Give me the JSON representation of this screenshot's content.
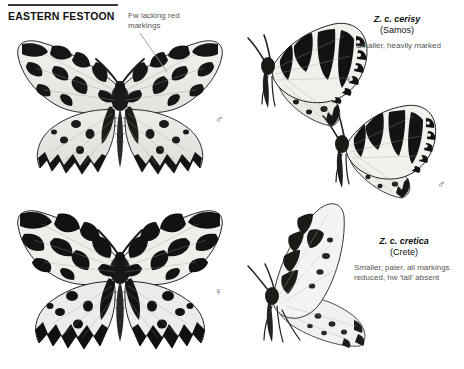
{
  "plate": {
    "title": "EASTERN FESTOON",
    "background": "#ffffff",
    "ink": "#111111",
    "caption_color": "#555555"
  },
  "callouts": [
    {
      "id": "fw-red-markings",
      "text": "Fw lacking red markings",
      "x": 128,
      "y": 11,
      "leader": {
        "x1": 140,
        "y1": 33,
        "x2": 167,
        "y2": 72
      }
    }
  ],
  "taxa": [
    {
      "id": "cerisy",
      "scientific": "Z. c. cerisy",
      "locality": "(Samos)",
      "description": "Smaller, heavily marked",
      "x": 356,
      "y": 14
    },
    {
      "id": "cretica",
      "scientific": "Z. c. cretica",
      "locality": "(Crete)",
      "description": "Smaller, paler, all markings reduced, hw 'tail' absent",
      "x": 348,
      "y": 236
    }
  ],
  "sex_marks": [
    {
      "id": "male-nominate",
      "symbol": "♂",
      "x": 215,
      "y": 114,
      "specimen": "nominate-male-dorsal"
    },
    {
      "id": "female-nominate",
      "symbol": "♀",
      "x": 214,
      "y": 286,
      "specimen": "nominate-female-dorsal"
    },
    {
      "id": "female-cerisy",
      "symbol": "♀",
      "x": 344,
      "y": 74,
      "specimen": "cerisy-female-lateral"
    },
    {
      "id": "male-cerisy",
      "symbol": "♂",
      "x": 437,
      "y": 179,
      "specimen": "cerisy-male-lateral"
    }
  ],
  "specimens": [
    {
      "id": "nominate-male-dorsal",
      "common_name": "Eastern Festoon",
      "view": "dorsal-spread",
      "sex": "male",
      "x": 14,
      "y": 28,
      "width": 210,
      "height": 160
    },
    {
      "id": "nominate-female-dorsal",
      "common_name": "Eastern Festoon",
      "view": "dorsal-spread",
      "sex": "female",
      "x": 14,
      "y": 200,
      "width": 210,
      "height": 160
    },
    {
      "id": "cerisy-female-lateral",
      "common_name": "Z. c. cerisy",
      "view": "lateral-closed",
      "sex": "female",
      "x": 248,
      "y": 18,
      "width": 140,
      "height": 110
    },
    {
      "id": "cerisy-male-lateral",
      "common_name": "Z. c. cerisy",
      "view": "lateral-closed",
      "sex": "male",
      "x": 322,
      "y": 100,
      "width": 125,
      "height": 100
    },
    {
      "id": "cretica-lateral",
      "common_name": "Z. c. cretica",
      "view": "lateral-closed",
      "sex": "unspecified",
      "x": 244,
      "y": 200,
      "width": 140,
      "height": 160
    }
  ]
}
